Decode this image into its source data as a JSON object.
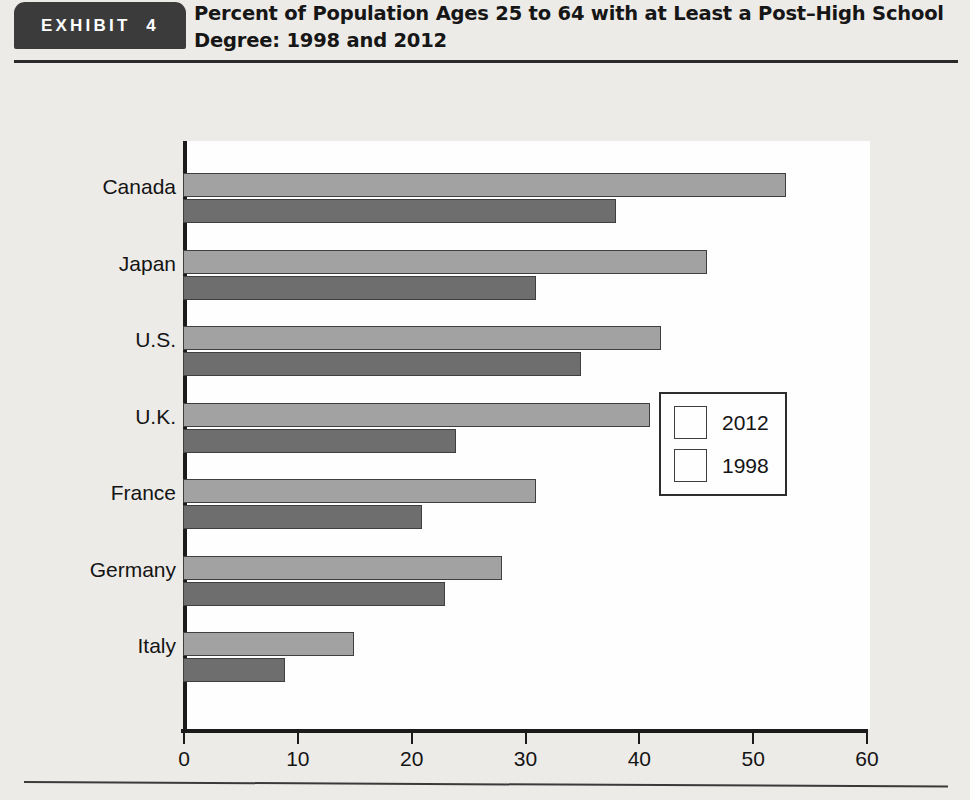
{
  "header": {
    "badge_label": "EXHIBIT  4",
    "title_line1": "Percent of Population Ages 25 to 64 with at Least a Post–High School",
    "title_line2": "Degree: 1998 and 2012"
  },
  "colors": {
    "page_background": "#edebe8",
    "plot_background": "#fefefe",
    "series_2012": "#a2a2a2",
    "series_1998": "#6e6e6e",
    "axis": "#1b1b1b",
    "badge_background": "#3b3b3b"
  },
  "chart_data": {
    "type": "bar",
    "orientation": "horizontal",
    "title": "Percent of Population Ages 25 to 64 with at Least a Post–High School Degree: 1998 and 2012",
    "categories": [
      "Canada",
      "Japan",
      "U.S.",
      "U.K.",
      "France",
      "Germany",
      "Italy"
    ],
    "series": [
      {
        "name": "2012",
        "values": [
          53,
          46,
          42,
          41,
          31,
          28,
          15
        ]
      },
      {
        "name": "1998",
        "values": [
          38,
          31,
          35,
          24,
          21,
          23,
          9
        ]
      }
    ],
    "xlabel": "",
    "ylabel": "",
    "xlim": [
      0,
      60
    ],
    "xticks": [
      0,
      10,
      20,
      30,
      40,
      50,
      60
    ],
    "xtick_labels": [
      "0",
      "10",
      "20",
      "30",
      "40",
      "50",
      "60"
    ],
    "grid": false,
    "legend_position": "center-right",
    "legend_entries": [
      "2012",
      "1998"
    ]
  }
}
